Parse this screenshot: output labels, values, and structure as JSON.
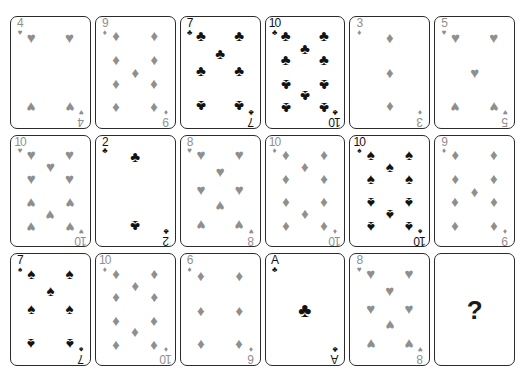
{
  "puzzle": {
    "title": "Playing card sequence puzzle",
    "grid": {
      "rows": 3,
      "columns": 6
    },
    "unknown_marker": "?"
  },
  "suit_glyphs": {
    "hearts": "♥",
    "diamonds": "♦",
    "clubs": "♣",
    "spades": "♠"
  },
  "suit_colors": {
    "red": "#8f8f8f",
    "black": "#121212"
  },
  "cards": [
    {
      "rank": "4",
      "suit": "hearts",
      "color": "red",
      "label": "4 of hearts"
    },
    {
      "rank": "9",
      "suit": "diamonds",
      "color": "red",
      "label": "9 of diamonds"
    },
    {
      "rank": "7",
      "suit": "clubs",
      "color": "black",
      "label": "7 of clubs"
    },
    {
      "rank": "10",
      "suit": "clubs",
      "color": "black",
      "label": "10 of clubs"
    },
    {
      "rank": "3",
      "suit": "diamonds",
      "color": "red",
      "label": "3 of diamonds"
    },
    {
      "rank": "5",
      "suit": "hearts",
      "color": "red",
      "label": "5 of hearts"
    },
    {
      "rank": "10",
      "suit": "hearts",
      "color": "red",
      "label": "10 of hearts"
    },
    {
      "rank": "2",
      "suit": "clubs",
      "color": "black",
      "label": "2 of clubs"
    },
    {
      "rank": "8",
      "suit": "hearts",
      "color": "red",
      "label": "8 of hearts"
    },
    {
      "rank": "10",
      "suit": "diamonds",
      "color": "red",
      "label": "10 of diamonds"
    },
    {
      "rank": "10",
      "suit": "spades",
      "color": "black",
      "label": "10 of spades"
    },
    {
      "rank": "9",
      "suit": "diamonds",
      "color": "red",
      "label": "9 of diamonds"
    },
    {
      "rank": "7",
      "suit": "spades",
      "color": "black",
      "label": "7 of spades"
    },
    {
      "rank": "10",
      "suit": "diamonds",
      "color": "red",
      "label": "10 of diamonds"
    },
    {
      "rank": "6",
      "suit": "diamonds",
      "color": "red",
      "label": "6 of diamonds"
    },
    {
      "rank": "A",
      "suit": "clubs",
      "color": "black",
      "label": "ace of clubs"
    },
    {
      "rank": "8",
      "suit": "hearts",
      "color": "red",
      "label": "8 of hearts"
    },
    {
      "rank": "?",
      "suit": null,
      "color": "black",
      "label": "unknown card"
    }
  ],
  "pip_layouts": {
    "A": [
      [
        50,
        50,
        0
      ]
    ],
    "2": [
      [
        50,
        16,
        0
      ],
      [
        50,
        84,
        1
      ]
    ],
    "3": [
      [
        50,
        16,
        0
      ],
      [
        50,
        50,
        0
      ],
      [
        50,
        84,
        1
      ]
    ],
    "4": [
      [
        23,
        16,
        0
      ],
      [
        77,
        16,
        0
      ],
      [
        23,
        84,
        1
      ],
      [
        77,
        84,
        1
      ]
    ],
    "5": [
      [
        23,
        16,
        0
      ],
      [
        77,
        16,
        0
      ],
      [
        50,
        50,
        0
      ],
      [
        23,
        84,
        1
      ],
      [
        77,
        84,
        1
      ]
    ],
    "6": [
      [
        23,
        16,
        0
      ],
      [
        77,
        16,
        0
      ],
      [
        23,
        50,
        0
      ],
      [
        77,
        50,
        0
      ],
      [
        23,
        84,
        1
      ],
      [
        77,
        84,
        1
      ]
    ],
    "7": [
      [
        23,
        14,
        0
      ],
      [
        77,
        14,
        0
      ],
      [
        23,
        48,
        0
      ],
      [
        77,
        48,
        0
      ],
      [
        50,
        31,
        0
      ],
      [
        23,
        83,
        1
      ],
      [
        77,
        83,
        1
      ]
    ],
    "8": [
      [
        23,
        14,
        0
      ],
      [
        77,
        14,
        0
      ],
      [
        23,
        48,
        0
      ],
      [
        77,
        48,
        0
      ],
      [
        50,
        31,
        0
      ],
      [
        50,
        65,
        1
      ],
      [
        23,
        83,
        1
      ],
      [
        77,
        83,
        1
      ]
    ],
    "9": [
      [
        23,
        14,
        0
      ],
      [
        77,
        14,
        0
      ],
      [
        23,
        37,
        0
      ],
      [
        77,
        37,
        0
      ],
      [
        50,
        50,
        0
      ],
      [
        23,
        62,
        1
      ],
      [
        77,
        62,
        1
      ],
      [
        23,
        85,
        1
      ],
      [
        77,
        85,
        1
      ]
    ],
    "10": [
      [
        23,
        14,
        0
      ],
      [
        77,
        14,
        0
      ],
      [
        23,
        37,
        0
      ],
      [
        77,
        37,
        0
      ],
      [
        50,
        26,
        0
      ],
      [
        23,
        62,
        1
      ],
      [
        77,
        62,
        1
      ],
      [
        23,
        85,
        1
      ],
      [
        77,
        85,
        1
      ],
      [
        50,
        73,
        1
      ]
    ]
  }
}
